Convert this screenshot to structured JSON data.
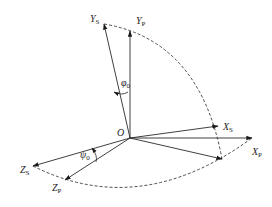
{
  "diagram": {
    "origin": {
      "label": "O",
      "x": 130,
      "y": 138
    },
    "axes": [
      {
        "id": "Ys",
        "base": "Y",
        "sub": "S",
        "tip": [
          104,
          24
        ],
        "label_pos": [
          90,
          22
        ]
      },
      {
        "id": "Yp",
        "base": "Y",
        "sub": "P",
        "tip": [
          130,
          31
        ],
        "label_pos": [
          136,
          24
        ]
      },
      {
        "id": "Xs",
        "base": "X",
        "sub": "S",
        "tip": [
          218,
          126
        ],
        "label_pos": [
          223,
          130
        ]
      },
      {
        "id": "Xp",
        "base": "X",
        "sub": "P",
        "tip": [
          252,
          138
        ],
        "label_pos": [
          252,
          155
        ]
      },
      {
        "id": "Zs",
        "base": "Z",
        "sub": "S",
        "tip": [
          33,
          166
        ],
        "label_pos": [
          20,
          173
        ]
      },
      {
        "id": "Zp",
        "base": "Z",
        "sub": "P",
        "tip": [
          65,
          180
        ],
        "label_pos": [
          52,
          191
        ]
      },
      {
        "id": "aux",
        "base": "",
        "sub": "",
        "tip": [
          222,
          159
        ],
        "label_pos": null
      }
    ],
    "angles": [
      {
        "id": "phi-top",
        "symbol": "φ",
        "sub": "0",
        "label_pos": [
          121,
          86
        ]
      },
      {
        "id": "phi-bottom",
        "symbol": "ψ",
        "sub": "0",
        "label_pos": [
          80,
          158
        ]
      }
    ],
    "colors": {
      "line": "#2a2a2a",
      "background": "#ffffff"
    }
  }
}
